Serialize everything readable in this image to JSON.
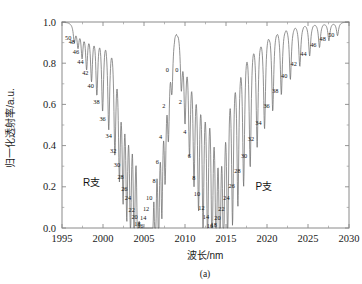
{
  "figure": {
    "caption": "(a)",
    "background": "#ffffff",
    "curve_color": "#6e6e6e",
    "frame_color": "#8a8a8a"
  },
  "branches": {
    "r_label": "R支",
    "p_label": "P支"
  },
  "chart_data": {
    "type": "line",
    "title": "",
    "subtitle": "",
    "xlabel": "波长/nm",
    "ylabel": "归一化透射率/a.u.",
    "xlim": [
      1995,
      2030
    ],
    "ylim": [
      0.0,
      1.0
    ],
    "xticks": [
      1995,
      2000,
      2005,
      2010,
      2015,
      2020,
      2025,
      2030
    ],
    "xticklabels": [
      "1995",
      "2000",
      "2005",
      "2010",
      "2015",
      "2020",
      "2025",
      "2030"
    ],
    "yticks": [
      0.0,
      0.2,
      0.4,
      0.6,
      0.8,
      1.0
    ],
    "yticklabels": [
      "0.0",
      "0.2",
      "0.4",
      "0.6",
      "0.8",
      "1.0"
    ],
    "grid": false,
    "legend": false,
    "minor_ticks_x": 1,
    "minor_ticks_y": 1,
    "baseline": 1.0,
    "annotations": [
      {
        "text": "R支",
        "x": 1998.6,
        "y": 0.205
      },
      {
        "text": "P支",
        "x": 2019.6,
        "y": 0.185
      }
    ],
    "series": [
      {
        "name": "归一化透射率",
        "description": "Absorption comb spectrum: R-branch lines (left, even J labels 50→16 decreasing wavelength order) and P-branch lines (right, even J labels 0→50), separated by a band gap near 2008.8 nm.",
        "lines": [
          {
            "branch": "R",
            "label": "50",
            "center": 1996.5,
            "depth": 0.085,
            "width": 0.175,
            "label_y": 0.925
          },
          {
            "branch": "R",
            "label": "48",
            "center": 1996.95,
            "depth": 0.105,
            "width": 0.175,
            "label_y": 0.905
          },
          {
            "branch": "R",
            "label": "46",
            "center": 1997.45,
            "depth": 0.15,
            "width": 0.175,
            "label_y": 0.858
          },
          {
            "branch": "R",
            "label": "44",
            "center": 1998.0,
            "depth": 0.2,
            "width": 0.175,
            "label_y": 0.808
          },
          {
            "branch": "R",
            "label": "42",
            "center": 1998.6,
            "depth": 0.255,
            "width": 0.175,
            "label_y": 0.752
          },
          {
            "branch": "R",
            "label": "40",
            "center": 1999.25,
            "depth": 0.32,
            "width": 0.175,
            "label_y": 0.69
          },
          {
            "branch": "R",
            "label": "38",
            "center": 1999.95,
            "depth": 0.395,
            "width": 0.175,
            "label_y": 0.612
          },
          {
            "branch": "R",
            "label": "36",
            "center": 2000.7,
            "depth": 0.475,
            "width": 0.175,
            "label_y": 0.533
          },
          {
            "branch": "R",
            "label": "34",
            "center": 2001.45,
            "depth": 0.56,
            "width": 0.175,
            "label_y": 0.448
          },
          {
            "branch": "R",
            "label": "32",
            "center": 2002.0,
            "depth": 0.63,
            "width": 0.175,
            "label_y": 0.378
          },
          {
            "branch": "R",
            "label": "30",
            "center": 2002.45,
            "depth": 0.7,
            "width": 0.175,
            "label_y": 0.308
          },
          {
            "branch": "R",
            "label": "28",
            "center": 2002.9,
            "depth": 0.76,
            "width": 0.175,
            "label_y": 0.248
          },
          {
            "branch": "R",
            "label": "26",
            "center": 2003.35,
            "depth": 0.815,
            "width": 0.175,
            "label_y": 0.193
          },
          {
            "branch": "R",
            "label": "24",
            "center": 2003.8,
            "depth": 0.86,
            "width": 0.175,
            "label_y": 0.148
          },
          {
            "branch": "R",
            "label": "22",
            "center": 2004.25,
            "depth": 0.905,
            "width": 0.175,
            "label_y": 0.09
          },
          {
            "branch": "R",
            "label": "20",
            "center": 2004.6,
            "depth": 0.935,
            "width": 0.175,
            "label_y": 0.055
          },
          {
            "branch": "R",
            "label": "18",
            "center": 2004.95,
            "depth": 0.955,
            "width": 0.175,
            "label_y": 0.022
          },
          {
            "branch": "R",
            "label": "16",
            "center": 2005.3,
            "depth": 0.96,
            "width": 0.175,
            "label_y": 0.01
          },
          {
            "branch": "R",
            "label": "14",
            "center": 2005.65,
            "depth": 0.95,
            "width": 0.175,
            "label_y": 0.05
          },
          {
            "branch": "R",
            "label": "12",
            "center": 2006.0,
            "depth": 0.92,
            "width": 0.175,
            "label_y": 0.095
          },
          {
            "branch": "R",
            "label": "10",
            "center": 2006.38,
            "depth": 0.875,
            "width": 0.175,
            "label_y": 0.15
          },
          {
            "branch": "R",
            "label": "8",
            "center": 2006.78,
            "depth": 0.8,
            "width": 0.175,
            "label_y": 0.23
          },
          {
            "branch": "R",
            "label": "6",
            "center": 2007.18,
            "depth": 0.71,
            "width": 0.175,
            "label_y": 0.32
          },
          {
            "branch": "R",
            "label": "4",
            "center": 2007.58,
            "depth": 0.59,
            "width": 0.175,
            "label_y": 0.442
          },
          {
            "branch": "R",
            "label": "2",
            "center": 2007.98,
            "depth": 0.44,
            "width": 0.175,
            "label_y": 0.595
          },
          {
            "branch": "R",
            "label": "0",
            "center": 2008.4,
            "depth": 0.27,
            "width": 0.175,
            "label_y": 0.768
          },
          {
            "branch": "P",
            "label": "0",
            "center": 2009.55,
            "depth": 0.27,
            "width": 0.175,
            "label_y": 0.768
          },
          {
            "branch": "P",
            "label": "2",
            "center": 2010.0,
            "depth": 0.42,
            "width": 0.175,
            "label_y": 0.615
          },
          {
            "branch": "P",
            "label": "4",
            "center": 2010.55,
            "depth": 0.56,
            "width": 0.175,
            "label_y": 0.47
          },
          {
            "branch": "P",
            "label": "6",
            "center": 2011.1,
            "depth": 0.68,
            "width": 0.175,
            "label_y": 0.35
          },
          {
            "branch": "P",
            "label": "8",
            "center": 2011.65,
            "depth": 0.785,
            "width": 0.175,
            "label_y": 0.245
          },
          {
            "branch": "P",
            "label": "10",
            "center": 2012.2,
            "depth": 0.86,
            "width": 0.175,
            "label_y": 0.165
          },
          {
            "branch": "P",
            "label": "12",
            "center": 2012.75,
            "depth": 0.915,
            "width": 0.175,
            "label_y": 0.1
          },
          {
            "branch": "P",
            "label": "14",
            "center": 2013.3,
            "depth": 0.945,
            "width": 0.175,
            "label_y": 0.055
          },
          {
            "branch": "P",
            "label": "16",
            "center": 2013.8,
            "depth": 0.96,
            "width": 0.175,
            "label_y": 0.012
          },
          {
            "branch": "P",
            "label": "18",
            "center": 2014.25,
            "depth": 0.958,
            "width": 0.175,
            "label_y": 0.018
          },
          {
            "branch": "P",
            "label": "20",
            "center": 2014.7,
            "depth": 0.94,
            "width": 0.175,
            "label_y": 0.052
          },
          {
            "branch": "P",
            "label": "22",
            "center": 2015.2,
            "depth": 0.905,
            "width": 0.175,
            "label_y": 0.092
          },
          {
            "branch": "P",
            "label": "24",
            "center": 2015.8,
            "depth": 0.86,
            "width": 0.175,
            "label_y": 0.148
          },
          {
            "branch": "P",
            "label": "26",
            "center": 2016.45,
            "depth": 0.8,
            "width": 0.175,
            "label_y": 0.208
          },
          {
            "branch": "P",
            "label": "28",
            "center": 2017.15,
            "depth": 0.73,
            "width": 0.175,
            "label_y": 0.278
          },
          {
            "branch": "P",
            "label": "30",
            "center": 2017.95,
            "depth": 0.655,
            "width": 0.175,
            "label_y": 0.352
          },
          {
            "branch": "P",
            "label": "32",
            "center": 2018.8,
            "depth": 0.575,
            "width": 0.175,
            "label_y": 0.433
          },
          {
            "branch": "P",
            "label": "34",
            "center": 2019.7,
            "depth": 0.495,
            "width": 0.175,
            "label_y": 0.513
          },
          {
            "branch": "P",
            "label": "36",
            "center": 2020.7,
            "depth": 0.415,
            "width": 0.175,
            "label_y": 0.592
          },
          {
            "branch": "P",
            "label": "38",
            "center": 2021.75,
            "depth": 0.34,
            "width": 0.175,
            "label_y": 0.668
          },
          {
            "branch": "P",
            "label": "40",
            "center": 2022.85,
            "depth": 0.27,
            "width": 0.175,
            "label_y": 0.738
          },
          {
            "branch": "P",
            "label": "42",
            "center": 2024.0,
            "depth": 0.21,
            "width": 0.175,
            "label_y": 0.798
          },
          {
            "branch": "P",
            "label": "44",
            "center": 2025.2,
            "depth": 0.16,
            "width": 0.175,
            "label_y": 0.848
          },
          {
            "branch": "P",
            "label": "46",
            "center": 2026.4,
            "depth": 0.12,
            "width": 0.175,
            "label_y": 0.888
          },
          {
            "branch": "P",
            "label": "48",
            "center": 2027.55,
            "depth": 0.088,
            "width": 0.175,
            "label_y": 0.918
          },
          {
            "branch": "P",
            "label": "50",
            "center": 2028.6,
            "depth": 0.065,
            "width": 0.175,
            "label_y": 0.938
          }
        ]
      }
    ]
  }
}
